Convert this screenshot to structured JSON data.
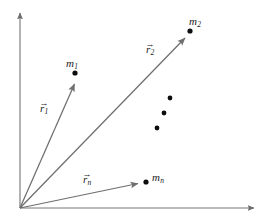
{
  "figure": {
    "background_color": "#ffffff",
    "line_color": "#6e6e6e",
    "axis_color": "#7a7a7a",
    "dot_color": "#0d0d0d",
    "text_color": "#1a1a1a",
    "width": 270,
    "height": 220
  },
  "axes": {
    "origin": {
      "x": 20,
      "y": 208
    },
    "vertical": {
      "name": "y-axis",
      "x1": 20,
      "y1": 208,
      "x2": 20,
      "y2": 11
    },
    "horizontal": {
      "name": "x-axis",
      "x1": 20,
      "y1": 208,
      "x2": 257,
      "y2": 208
    }
  },
  "vectors": [
    {
      "id": "r1",
      "label": "r",
      "subscript": "1",
      "accent": "arrow",
      "from": {
        "x": 20,
        "y": 208
      },
      "to": {
        "x": 74,
        "y": 81
      },
      "label_pos": {
        "x": 40,
        "y": 103
      }
    },
    {
      "id": "r2",
      "label": "r",
      "subscript": "2",
      "accent": "arrow",
      "from": {
        "x": 20,
        "y": 208
      },
      "to": {
        "x": 187,
        "y": 35
      },
      "label_pos": {
        "x": 146,
        "y": 44
      }
    },
    {
      "id": "rn",
      "label": "r",
      "subscript": "n",
      "accent": "arrow",
      "from": {
        "x": 20,
        "y": 208
      },
      "to": {
        "x": 141,
        "y": 183
      },
      "label_pos": {
        "x": 83,
        "y": 174
      }
    }
  ],
  "masses": [
    {
      "id": "m1",
      "label": "m",
      "subscript": "1",
      "dot": {
        "x": 75,
        "y": 73
      },
      "label_pos": {
        "x": 66,
        "y": 58
      }
    },
    {
      "id": "m2",
      "label": "m",
      "subscript": "2",
      "dot": {
        "x": 190,
        "y": 31
      },
      "label_pos": {
        "x": 189,
        "y": 16
      }
    },
    {
      "id": "mn",
      "label": "m",
      "subscript": "n",
      "dot": {
        "x": 146,
        "y": 182
      },
      "label_pos": {
        "x": 152,
        "y": 172
      }
    }
  ],
  "ellipsis_dots": [
    {
      "x": 170,
      "y": 98
    },
    {
      "x": 164,
      "y": 113
    },
    {
      "x": 157,
      "y": 128
    }
  ],
  "dot_radius": 2.6,
  "ellipsis_dot_radius": 2.4
}
